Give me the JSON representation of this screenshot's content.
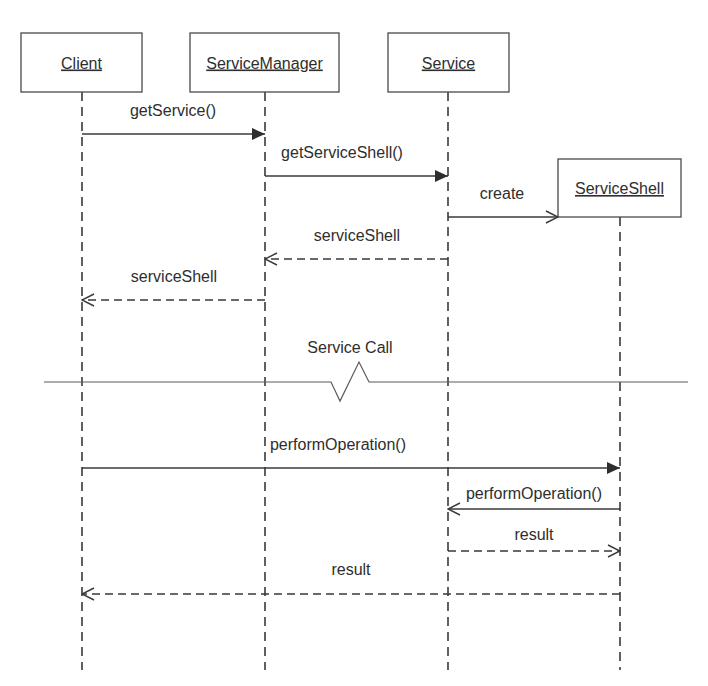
{
  "diagram": {
    "type": "UML sequence diagram",
    "colors": {
      "line": "#3a3a3a",
      "text": "#2e2e2e",
      "box_fill": "#ffffff",
      "background": "#ffffff"
    },
    "objects": [
      {
        "id": "client",
        "label": "Client",
        "x": 21,
        "y": 33,
        "w": 121,
        "h": 59,
        "lifeline_x": 82,
        "lifeline_top": 92
      },
      {
        "id": "servicemanager",
        "label": "ServiceManager",
        "x": 190,
        "y": 33,
        "w": 149,
        "h": 59,
        "lifeline_x": 265,
        "lifeline_top": 92
      },
      {
        "id": "service",
        "label": "Service",
        "x": 388,
        "y": 33,
        "w": 121,
        "h": 59,
        "lifeline_x": 448,
        "lifeline_top": 92
      },
      {
        "id": "serviceshell",
        "label": "ServiceShell",
        "x": 558,
        "y": 159,
        "w": 123,
        "h": 58,
        "lifeline_x": 620,
        "lifeline_top": 217
      }
    ],
    "lifeline_bottom": 670,
    "messages": [
      {
        "id": "getservice",
        "label": "getService()",
        "from": "client",
        "to": "servicemanager",
        "y": 134,
        "style": "solid",
        "head": "filled",
        "label_x": 173,
        "label_y": 116
      },
      {
        "id": "getserviceshell",
        "label": "getServiceShell()",
        "from": "servicemanager",
        "to": "service",
        "y": 176,
        "style": "solid",
        "head": "filled",
        "label_x": 342,
        "label_y": 158
      },
      {
        "id": "create",
        "label": "create",
        "from": "service",
        "to": "serviceshell",
        "y": 217,
        "style": "solid",
        "head": "open",
        "label_x": 502,
        "label_y": 199,
        "end_x": 558
      },
      {
        "id": "serviceshell-return-1",
        "label": "serviceShell",
        "from": "service",
        "to": "servicemanager",
        "y": 259,
        "style": "dashed",
        "head": "open",
        "label_x": 357,
        "label_y": 241
      },
      {
        "id": "serviceshell-return-2",
        "label": "serviceShell",
        "from": "servicemanager",
        "to": "client",
        "y": 300,
        "style": "dashed",
        "head": "open",
        "label_x": 174,
        "label_y": 282
      },
      {
        "id": "performoperation-1",
        "label": "performOperation()",
        "from": "client",
        "to": "serviceshell",
        "y": 468,
        "style": "solid",
        "head": "filled",
        "label_x": 338,
        "label_y": 450
      },
      {
        "id": "performoperation-2",
        "label": "performOperation()",
        "from": "serviceshell",
        "to": "service",
        "y": 509,
        "style": "solid",
        "head": "open",
        "label_x": 534,
        "label_y": 499
      },
      {
        "id": "result-1",
        "label": "result",
        "from": "service",
        "to": "serviceshell",
        "y": 551,
        "style": "dashed",
        "head": "open",
        "label_x": 534,
        "label_y": 540
      },
      {
        "id": "result-2",
        "label": "result",
        "from": "serviceshell",
        "to": "client",
        "y": 594,
        "style": "dashed",
        "head": "open",
        "label_x": 351,
        "label_y": 575
      }
    ],
    "separator": {
      "label": "Service Call",
      "label_x": 350,
      "label_y": 353,
      "y": 382,
      "x1": 44,
      "x2": 688,
      "zigzag": [
        [
          331,
          382
        ],
        [
          340,
          401
        ],
        [
          359,
          362
        ],
        [
          369,
          382
        ]
      ]
    }
  }
}
